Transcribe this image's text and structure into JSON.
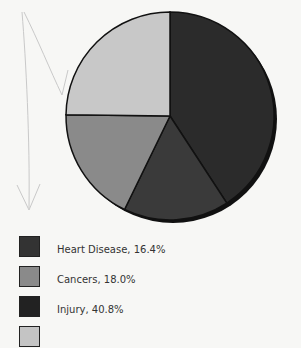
{
  "chart_data": {
    "type": "pie",
    "title": "",
    "start_angle_deg": 0,
    "direction": "clockwise",
    "slices": [
      {
        "label": "Injury",
        "value": 40.8,
        "color": "#2b2b2b"
      },
      {
        "label": "Heart Disease",
        "value": 16.4,
        "color": "#3a3a3a"
      },
      {
        "label": "Cancers",
        "value": 18.0,
        "color": "#8a8a8a"
      },
      {
        "label": "",
        "value": 24.8,
        "color": "#c8c8c8"
      }
    ],
    "legend": [
      {
        "text": "Heart Disease, 16.4%",
        "color": "#333333"
      },
      {
        "text": "Cancers, 18.0%",
        "color": "#8a8a8a"
      },
      {
        "text": "Injury, 40.8%",
        "color": "#222222"
      },
      {
        "text": "",
        "color": "#c4c4c4"
      }
    ],
    "legend_position": "bottom-left"
  }
}
